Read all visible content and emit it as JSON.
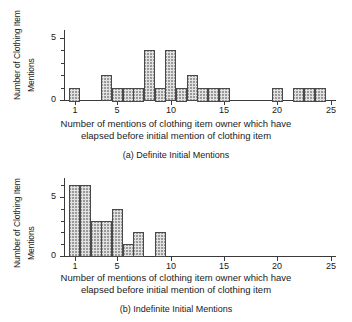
{
  "figure": {
    "axis_titles": {
      "y_line1": "Number of Clothing Item",
      "y_line2": "Mentions",
      "x_line1": "Number of mentions of clothing item owner which have",
      "x_line2": "elapsed before initial mention of clothing item"
    },
    "panels": [
      {
        "caption": "(a) Definite Initial Mentions"
      },
      {
        "caption": "(b) Indefinite Initial Mentions"
      }
    ]
  },
  "chart_data": [
    {
      "type": "bar",
      "title": "(a) Definite Initial Mentions",
      "xlabel": "Number of mentions of clothing item owner which have elapsed before initial mention of clothing item",
      "ylabel": "Number of Clothing Item Mentions",
      "xlim": [
        0,
        25.5
      ],
      "ylim": [
        0,
        5.6
      ],
      "xticks": [
        1,
        5,
        10,
        15,
        20,
        25
      ],
      "yticks": [
        0,
        5
      ],
      "yminorticks": [
        1,
        2,
        3,
        4
      ],
      "grid": false,
      "legend": false,
      "bin_width": 1,
      "categories": [
        1,
        4,
        5,
        6,
        7,
        8,
        9,
        10,
        11,
        12,
        13,
        14,
        15,
        20,
        22,
        23,
        24
      ],
      "values": [
        1,
        2,
        1,
        1,
        1,
        4,
        1,
        4,
        1,
        2,
        1,
        1,
        1,
        1,
        1,
        1,
        1
      ]
    },
    {
      "type": "bar",
      "title": "(b) Indefinite Initial Mentions",
      "xlabel": "Number of mentions of clothing item owner which have elapsed before initial mention of clothing item",
      "ylabel": "Number of Clothing Item Mentions",
      "xlim": [
        0,
        25.5
      ],
      "ylim": [
        0,
        6.6
      ],
      "xticks": [
        1,
        5,
        10,
        15,
        20,
        25
      ],
      "yticks": [
        0,
        5
      ],
      "yminorticks": [
        1,
        2,
        3,
        4,
        6
      ],
      "grid": false,
      "legend": false,
      "bin_width": 1,
      "categories": [
        1,
        2,
        3,
        4,
        5,
        6,
        7,
        9
      ],
      "values": [
        6,
        6,
        3,
        3,
        4,
        1,
        2,
        2
      ]
    }
  ]
}
